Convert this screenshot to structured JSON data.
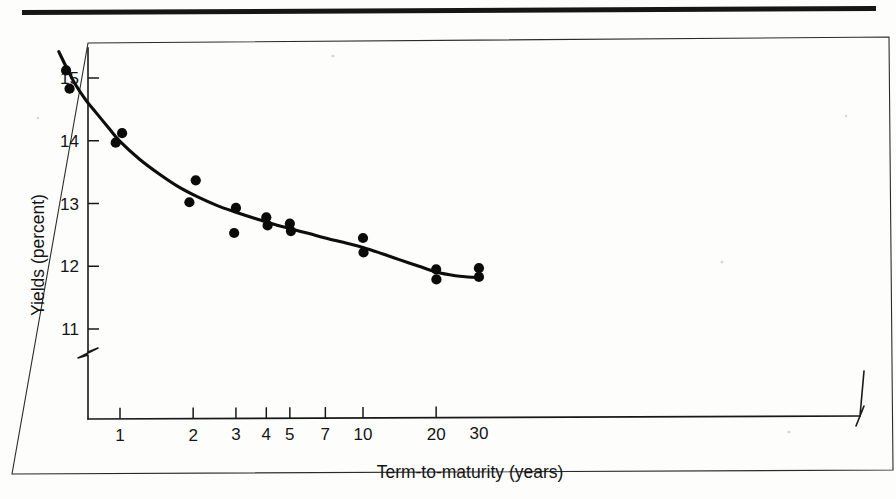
{
  "figure": {
    "background_color": "#fdfdfc",
    "ink_color": "#0d0d0d",
    "top_rule": true,
    "frame": true
  },
  "chart_data": {
    "type": "scatter",
    "title": "",
    "subtitle": "",
    "xlabel": "Term-to-maturity (years)",
    "ylabel": "Yields (percent)",
    "x_scale": "log",
    "y_scale": "linear",
    "xlim": [
      0.55,
      30
    ],
    "ylim": [
      11.0,
      15.55
    ],
    "y_axis_break": true,
    "y_axis_break_note": "axis broken below 11",
    "x_axis_break": true,
    "x_axis_break_note": "axis broken at right end beyond 30",
    "grid": false,
    "legend": null,
    "xticks": [
      1,
      2,
      3,
      4,
      5,
      7,
      10,
      20,
      30
    ],
    "xticklabels": [
      "1",
      "2",
      "3",
      "4",
      "5",
      "7",
      "10",
      "20",
      "30"
    ],
    "yticks": [
      11,
      12,
      13,
      14,
      15
    ],
    "yticklabels": [
      "11",
      "12",
      "13",
      "14",
      "15"
    ],
    "points": [
      {
        "x": 0.6,
        "y": 15.12
      },
      {
        "x": 0.62,
        "y": 14.83
      },
      {
        "x": 1.02,
        "y": 14.12
      },
      {
        "x": 0.96,
        "y": 13.97
      },
      {
        "x": 2.05,
        "y": 13.37
      },
      {
        "x": 1.93,
        "y": 13.02
      },
      {
        "x": 3.0,
        "y": 12.93
      },
      {
        "x": 2.95,
        "y": 12.53
      },
      {
        "x": 4.0,
        "y": 12.78
      },
      {
        "x": 4.05,
        "y": 12.65
      },
      {
        "x": 5.0,
        "y": 12.68
      },
      {
        "x": 5.05,
        "y": 12.56
      },
      {
        "x": 10.0,
        "y": 12.45
      },
      {
        "x": 10.05,
        "y": 12.22
      },
      {
        "x": 20.0,
        "y": 11.95
      },
      {
        "x": 20.05,
        "y": 11.79
      },
      {
        "x": 30.0,
        "y": 11.97
      },
      {
        "x": 30.0,
        "y": 11.83
      }
    ],
    "fit_curve": {
      "description": "smooth decaying fitted yield curve",
      "points": [
        {
          "x": 0.56,
          "y": 15.42
        },
        {
          "x": 0.6,
          "y": 15.18
        },
        {
          "x": 0.65,
          "y": 14.92
        },
        {
          "x": 0.72,
          "y": 14.66
        },
        {
          "x": 0.8,
          "y": 14.44
        },
        {
          "x": 0.9,
          "y": 14.2
        },
        {
          "x": 1.0,
          "y": 13.99
        },
        {
          "x": 1.2,
          "y": 13.71
        },
        {
          "x": 1.45,
          "y": 13.47
        },
        {
          "x": 1.75,
          "y": 13.26
        },
        {
          "x": 2.1,
          "y": 13.1
        },
        {
          "x": 2.5,
          "y": 12.97
        },
        {
          "x": 3.0,
          "y": 12.86
        },
        {
          "x": 3.6,
          "y": 12.76
        },
        {
          "x": 4.3,
          "y": 12.67
        },
        {
          "x": 5.0,
          "y": 12.6
        },
        {
          "x": 6.0,
          "y": 12.52
        },
        {
          "x": 7.0,
          "y": 12.45
        },
        {
          "x": 8.5,
          "y": 12.37
        },
        {
          "x": 10.0,
          "y": 12.3
        },
        {
          "x": 12.0,
          "y": 12.2
        },
        {
          "x": 14.0,
          "y": 12.11
        },
        {
          "x": 17.0,
          "y": 12.0
        },
        {
          "x": 20.0,
          "y": 11.91
        },
        {
          "x": 24.0,
          "y": 11.85
        },
        {
          "x": 27.0,
          "y": 11.83
        },
        {
          "x": 30.0,
          "y": 11.82
        }
      ]
    }
  }
}
